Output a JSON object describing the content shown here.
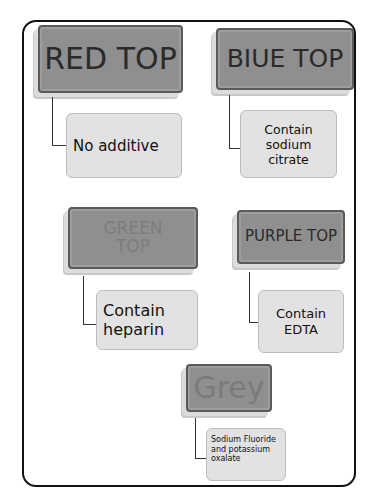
{
  "diagram": {
    "type": "blood collection tube color guide",
    "tubes": [
      {
        "head": "RED TOP",
        "note": "No additive"
      },
      {
        "head": "BIUE TOP",
        "note": "Contain sodium citrate"
      },
      {
        "head": "GREEN TOP",
        "note": "Contain heparin"
      },
      {
        "head": "PURPLE TOP",
        "note": "Contain EDTA"
      },
      {
        "head": "Grey",
        "note": "Sodium Fluoride and potassium oxalate"
      }
    ]
  }
}
